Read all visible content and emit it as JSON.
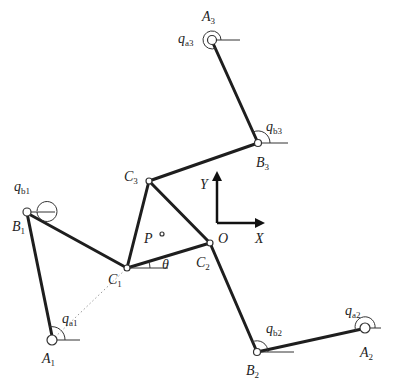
{
  "diagram": {
    "type": "planar 3-RRR parallel manipulator kinematic diagram",
    "labels": {
      "A1": "A",
      "A1_sub": "1",
      "A2": "A",
      "A2_sub": "2",
      "A3": "A",
      "A3_sub": "3",
      "B1": "B",
      "B1_sub": "1",
      "B2": "B",
      "B2_sub": "2",
      "B3": "B",
      "B3_sub": "3",
      "C1": "C",
      "C1_sub": "1",
      "C2": "C",
      "C2_sub": "2",
      "C3": "C",
      "C3_sub": "3",
      "qa1": "q",
      "qa1_sub": "a1",
      "qa2": "q",
      "qa2_sub": "a2",
      "qa3": "q",
      "qa3_sub": "a3",
      "qb1": "q",
      "qb1_sub": "b1",
      "qb2": "q",
      "qb2_sub": "b2",
      "qb3": "q",
      "qb3_sub": "b3",
      "P": "P",
      "O": "O",
      "theta": "θ",
      "X": "X",
      "Y": "Y"
    },
    "points": {
      "A1": [
        52,
        340
      ],
      "A2": [
        365,
        328
      ],
      "A3": [
        212,
        40
      ],
      "B1": [
        27,
        212
      ],
      "B2": [
        257,
        352
      ],
      "B3": [
        258,
        143
      ],
      "C1": [
        127,
        268
      ],
      "C2": [
        210,
        243
      ],
      "C3": [
        149,
        181
      ],
      "P": [
        162,
        234
      ],
      "axes_origin": [
        217,
        223
      ]
    },
    "colors": {
      "link": "#1e1e1e",
      "thin": "#333333",
      "background": "#ffffff"
    }
  }
}
